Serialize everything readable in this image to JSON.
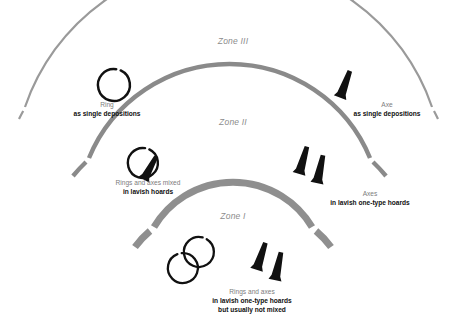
{
  "figure": {
    "kind": "concentric-zone-diagram",
    "background_color": "#ffffff",
    "arc_color_zone3": "#9a9a9a",
    "arc_color_zone2": "#8a8a8a",
    "arc_color_zone1": "#8f8f8f",
    "object_color": "#111111",
    "zone_label_color": "#8c8c8c",
    "caption_head_color": "#7d7d7d",
    "caption_body_color": "#101010"
  },
  "zones": [
    {
      "id": "zone-3",
      "label": "Zone III",
      "label_x": 233,
      "label_y": 41,
      "arc_thickness": 2.2
    },
    {
      "id": "zone-2",
      "label": "Zone II",
      "label_x": 233,
      "label_y": 122,
      "arc_thickness": 4.4
    },
    {
      "id": "zone-1",
      "label": "Zone I",
      "label_x": 233,
      "label_y": 216,
      "arc_thickness": 7.0
    }
  ],
  "captions": [
    {
      "id": "caption-zone3-ring",
      "head": "Ring",
      "body": "as single depositions",
      "x": 107,
      "y": 100
    },
    {
      "id": "caption-zone3-axe",
      "head": "Axe",
      "body": "as single depositions",
      "x": 387,
      "y": 100
    },
    {
      "id": "caption-zone2-rings-axes",
      "head": "Rings and axes mixed",
      "body": "in lavish hoards",
      "x": 148,
      "y": 178
    },
    {
      "id": "caption-zone2-axes",
      "head": "Axes",
      "body": "in lavish one-type hoards",
      "x": 370,
      "y": 189
    },
    {
      "id": "caption-zone1-rings-axes",
      "head": "Rings and axes",
      "body": "in lavish one-type hoards\nbut usually not mixed",
      "x": 252,
      "y": 287
    }
  ],
  "objects": [
    {
      "id": "ring-zone3",
      "type": "ring",
      "count": 1
    },
    {
      "id": "axe-zone3",
      "type": "axe",
      "count": 1
    },
    {
      "id": "ring-axe-zone2",
      "type": "ring-and-axe",
      "count": 2
    },
    {
      "id": "axes-zone2",
      "type": "axe-pair",
      "count": 2
    },
    {
      "id": "rings-zone1",
      "type": "ring-pair",
      "count": 2
    },
    {
      "id": "axes-zone1",
      "type": "axe-pair",
      "count": 2
    }
  ]
}
